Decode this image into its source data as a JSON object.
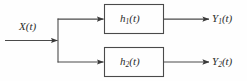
{
  "diagram": {
    "type": "block-diagram",
    "background_color": "#fefefe",
    "line_color": "#4a4a4a",
    "text_color": "#2b2b2b",
    "input": {
      "label_main": "X",
      "label_arg": "(t)",
      "label_full": "X(t)"
    },
    "blocks": [
      {
        "id": "block-1",
        "label_main": "h",
        "label_sub": "1",
        "label_arg": "(t)",
        "label_full": "h1(t)"
      },
      {
        "id": "block-2",
        "label_main": "h",
        "label_sub": "2",
        "label_arg": "(t)",
        "label_full": "h2(t)"
      }
    ],
    "outputs": [
      {
        "id": "output-1",
        "label_main": "Y",
        "label_sub": "1",
        "label_arg": "(t)",
        "label_full": "Y1(t)"
      },
      {
        "id": "output-2",
        "label_main": "Y",
        "label_sub": "2",
        "label_arg": "(t)",
        "label_full": "Y2(t)"
      }
    ]
  }
}
